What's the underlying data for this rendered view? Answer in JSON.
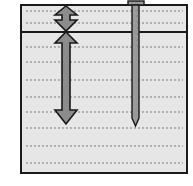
{
  "diagram": {
    "colors": {
      "background": "#ffffff",
      "fill": "#e6e6e6",
      "border": "#1a1a1a",
      "arrow_fill": "#8c8c8c",
      "rod_fill": "#9a9a9a",
      "dash": "#7a7a7a"
    },
    "box": {
      "x": 21,
      "y": 5,
      "width": 166,
      "height": 168
    },
    "divider_y": 32,
    "upper_arrow": {
      "label": "upper-layer-depth",
      "x": 66,
      "y_top": 6,
      "y_bottom": 31
    },
    "lower_arrow": {
      "label": "lower-depth",
      "x": 66,
      "y_top": 32,
      "y_bottom": 125
    },
    "rod": {
      "x": 135,
      "y_top": 2,
      "y_tip": 127,
      "width": 7
    }
  }
}
